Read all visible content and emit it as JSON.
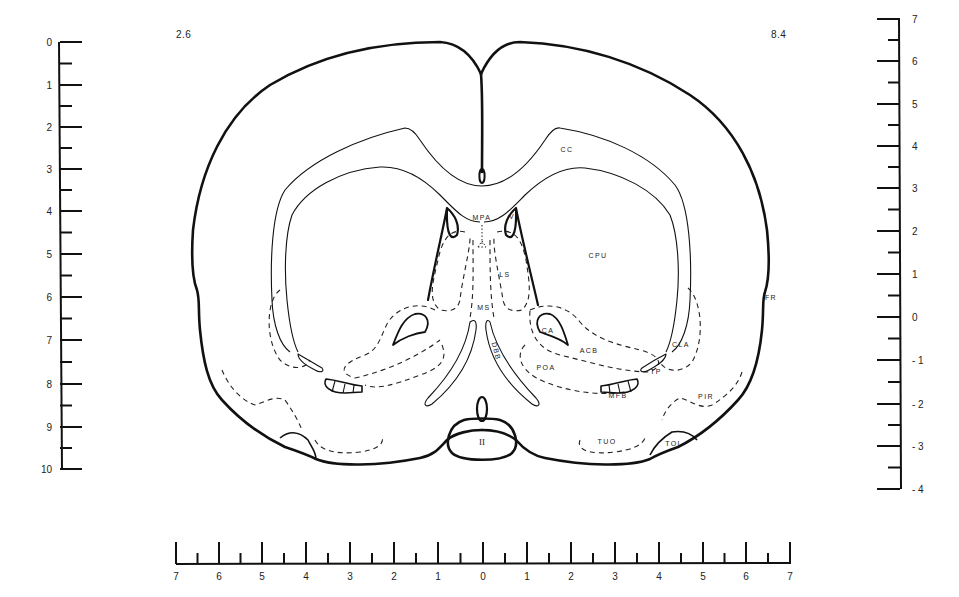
{
  "plate": {
    "left_corner_value": "2.6",
    "right_corner_value": "8.4"
  },
  "scales": {
    "left_vertical": {
      "labels": [
        "0",
        "1",
        "2",
        "3",
        "4",
        "5",
        "6",
        "7",
        "8",
        "9",
        "10"
      ],
      "major_y": [
        42,
        85,
        127,
        169,
        211,
        254,
        297,
        340,
        384,
        427,
        469
      ]
    },
    "right_vertical": {
      "labels": [
        "7",
        "6",
        "5",
        "4",
        "3",
        "2",
        "1",
        "0",
        "- 1",
        "- 2",
        "- 3",
        "- 4"
      ],
      "major_y": [
        19,
        61,
        104,
        146,
        188,
        231,
        274,
        317,
        360,
        404,
        446,
        489
      ]
    },
    "bottom_horizontal": {
      "labels": [
        "7",
        "6",
        "5",
        "4",
        "3",
        "2",
        "1",
        "0",
        "1",
        "2",
        "3",
        "4",
        "5",
        "6",
        "7"
      ],
      "major_x": [
        176,
        219,
        262,
        306,
        350,
        394,
        438,
        483,
        527,
        571,
        615,
        659,
        703,
        746,
        790
      ]
    }
  },
  "structures": [
    {
      "id": "cc",
      "label": "CC",
      "x": 567,
      "y": 152
    },
    {
      "id": "mpa",
      "label": "MPA",
      "x": 482,
      "y": 220
    },
    {
      "id": "v",
      "label": "V",
      "x": 512,
      "y": 219
    },
    {
      "id": "cpu",
      "label": "CPU",
      "x": 598,
      "y": 258
    },
    {
      "id": "ls",
      "label": "LS",
      "x": 505,
      "y": 277
    },
    {
      "id": "ms",
      "label": "MS",
      "x": 484,
      "y": 310
    },
    {
      "id": "ca",
      "label": "CA",
      "x": 548,
      "y": 333
    },
    {
      "id": "acb",
      "label": "ACB",
      "x": 589,
      "y": 353
    },
    {
      "id": "dbb",
      "label": "DBB",
      "x": 494,
      "y": 352
    },
    {
      "id": "poa",
      "label": "POA",
      "x": 546,
      "y": 370
    },
    {
      "id": "mfb",
      "label": "MFB",
      "x": 618,
      "y": 398
    },
    {
      "id": "tp",
      "label": "TP",
      "x": 656,
      "y": 374
    },
    {
      "id": "cla",
      "label": "CLA",
      "x": 681,
      "y": 347
    },
    {
      "id": "fr",
      "label": "FR",
      "x": 771,
      "y": 300
    },
    {
      "id": "pir",
      "label": "PIR",
      "x": 706,
      "y": 399
    },
    {
      "id": "tuo",
      "label": "TUO",
      "x": 607,
      "y": 444
    },
    {
      "id": "tol",
      "label": "TOL",
      "x": 674,
      "y": 446
    },
    {
      "id": "ii",
      "label": "II",
      "x": 482,
      "y": 445
    }
  ],
  "colors": {
    "ink": "#111111",
    "paper": "#ffffff"
  }
}
